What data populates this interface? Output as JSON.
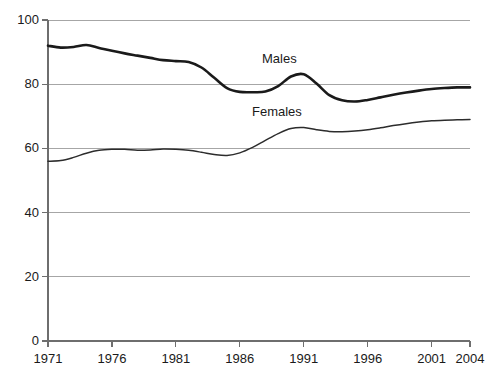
{
  "chart_data": {
    "type": "line",
    "title": "",
    "subtitle": "",
    "xlabel": "",
    "ylabel": "",
    "xlim": [
      1971,
      2004
    ],
    "ylim": [
      0,
      100
    ],
    "grid": "horizontal",
    "legend_position": "inline-annotations",
    "x_ticks": [
      "1971",
      "1976",
      "1981",
      "1986",
      "1991",
      "1996",
      "2001",
      "2004"
    ],
    "x_tick_values": [
      1971,
      1976,
      1981,
      1986,
      1991,
      1996,
      2001,
      2004
    ],
    "y_ticks": [
      "0",
      "20",
      "40",
      "60",
      "80",
      "100"
    ],
    "y_tick_values": [
      0,
      20,
      40,
      60,
      80,
      100
    ],
    "x": [
      1971,
      1972,
      1973,
      1974,
      1975,
      1976,
      1977,
      1978,
      1979,
      1980,
      1981,
      1982,
      1983,
      1984,
      1985,
      1986,
      1987,
      1988,
      1989,
      1990,
      1991,
      1992,
      1993,
      1994,
      1995,
      1996,
      1997,
      1998,
      1999,
      2000,
      2001,
      2002,
      2003,
      2004
    ],
    "series": [
      {
        "name": "Males",
        "color": "#1a1a1a",
        "width": 2.6,
        "values": [
          92.0,
          91.4,
          91.6,
          92.2,
          91.3,
          90.4,
          89.6,
          88.9,
          88.2,
          87.5,
          87.2,
          86.9,
          85.2,
          82.0,
          78.8,
          77.6,
          77.5,
          77.7,
          79.4,
          82.4,
          83.1,
          80.2,
          76.6,
          75.0,
          74.6,
          75.1,
          75.9,
          76.7,
          77.4,
          78.0,
          78.5,
          78.8,
          79.0,
          79.0
        ]
      },
      {
        "name": "Females",
        "color": "#2c2c2c",
        "width": 1.5,
        "values": [
          56.0,
          56.2,
          57.2,
          58.5,
          59.4,
          59.7,
          59.7,
          59.4,
          59.5,
          59.8,
          59.7,
          59.4,
          58.8,
          58.1,
          57.8,
          58.6,
          60.3,
          62.5,
          64.6,
          66.2,
          66.5,
          65.8,
          65.3,
          65.2,
          65.4,
          65.8,
          66.4,
          67.1,
          67.7,
          68.2,
          68.6,
          68.8,
          68.9,
          69.0
        ]
      }
    ],
    "annotations": [
      {
        "text": "Males",
        "x_px": 262,
        "y_px": 51
      },
      {
        "text": "Females",
        "x_px": 252,
        "y_px": 104
      }
    ],
    "geometry": {
      "plot_left_px": 48,
      "plot_right_px": 470,
      "plot_top_px": 20,
      "plot_bottom_px": 341,
      "axis_color": "#808080",
      "gridline_color": "#a6a6a6",
      "background": "#ffffff"
    }
  }
}
